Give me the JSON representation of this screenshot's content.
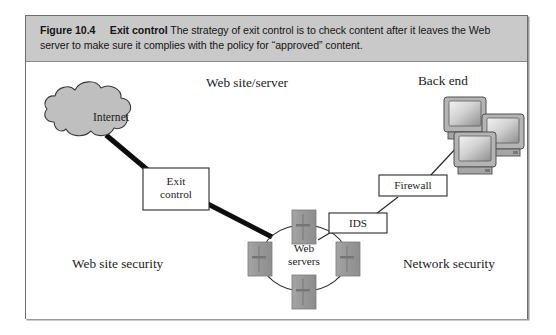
{
  "figure": {
    "number": "Figure 10.4",
    "title": "Exit control",
    "caption": " The strategy of exit control is to check content after it leaves the Web server to make sure it complies with the policy for “approved” content."
  },
  "diagram": {
    "type": "network-architecture-diagram",
    "zone_labels": {
      "top_center": "Web site/server",
      "top_right": "Back end",
      "bottom_left": "Web site security",
      "bottom_right": "Network security"
    },
    "nodes": [
      {
        "id": "internet",
        "label": "Internet",
        "shape": "cloud",
        "fill": "#bfbfbf"
      },
      {
        "id": "exit-control",
        "label": "Exit\ncontrol",
        "shape": "rectangle",
        "fill": "#ffffff"
      },
      {
        "id": "web-servers",
        "label": "Web\nservers",
        "shape": "server-ring",
        "fill": "#9a9a9a",
        "server_count": 4
      },
      {
        "id": "ids",
        "label": "IDS",
        "shape": "rectangle",
        "fill": "#ffffff"
      },
      {
        "id": "firewall",
        "label": "Firewall",
        "shape": "rectangle",
        "fill": "#ffffff"
      },
      {
        "id": "back-end",
        "label": "Back end",
        "shape": "monitor-cluster",
        "fill": "#a8a8a8",
        "monitor_count": 3
      }
    ],
    "links": [
      {
        "from": "internet",
        "to": "exit-control",
        "weight": "thick"
      },
      {
        "from": "exit-control",
        "to": "web-servers",
        "weight": "thick"
      },
      {
        "from": "web-servers",
        "to": "ids",
        "weight": "thin"
      },
      {
        "from": "ids",
        "to": "firewall",
        "weight": "thin"
      },
      {
        "from": "firewall",
        "to": "back-end",
        "weight": "thin"
      }
    ],
    "colors": {
      "frame_border": "#6d6d6d",
      "caption_background": "#c9c9c9",
      "cloud_fill": "#bfbfbf",
      "server_fill": "#9a9a9a",
      "monitor_fill": "#a8a8a8",
      "line": "#111111",
      "text": "#1d1d1d",
      "page_background": "#ffffff"
    }
  }
}
